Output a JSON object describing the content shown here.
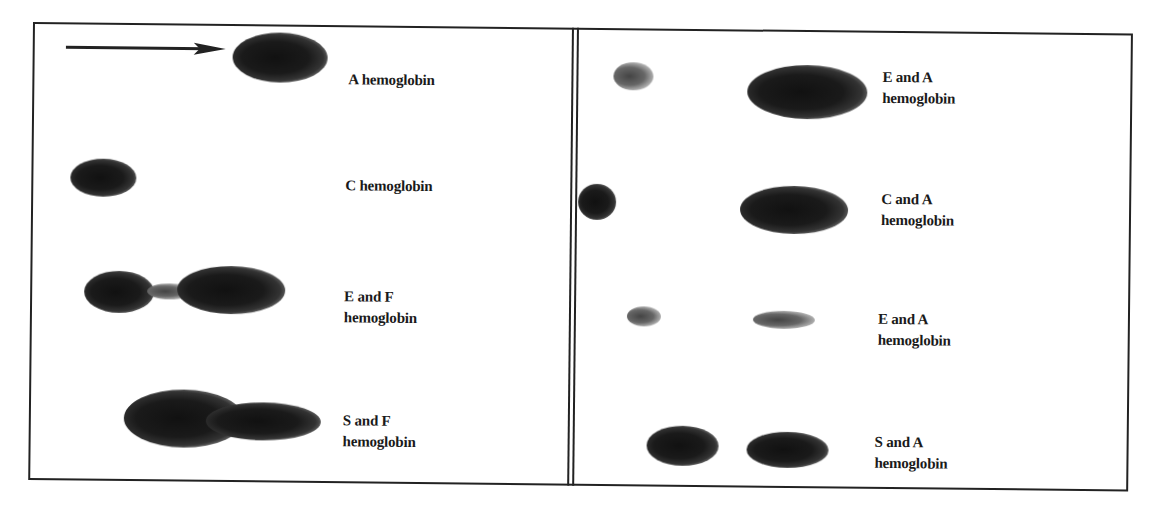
{
  "figure": {
    "type": "hemoglobin electrophoresis diagram",
    "direction_arrow": "arrow-right",
    "left_panel": {
      "lanes": [
        {
          "label_line1": "A hemoglobin",
          "label_line2": ""
        },
        {
          "label_line1": "C hemoglobin",
          "label_line2": ""
        },
        {
          "label_line1": "E and F",
          "label_line2": "hemoglobin"
        },
        {
          "label_line1": "S and F",
          "label_line2": "hemoglobin"
        }
      ]
    },
    "right_panel": {
      "lanes": [
        {
          "label_line1": "E and A",
          "label_line2": "hemoglobin"
        },
        {
          "label_line1": "C and A",
          "label_line2": "hemoglobin"
        },
        {
          "label_line1": "E and A",
          "label_line2": "hemoglobin"
        },
        {
          "label_line1": "S and A",
          "label_line2": "hemoglobin"
        }
      ]
    },
    "colors": {
      "ink": "#1a1a1a",
      "background": "#ffffff"
    }
  }
}
